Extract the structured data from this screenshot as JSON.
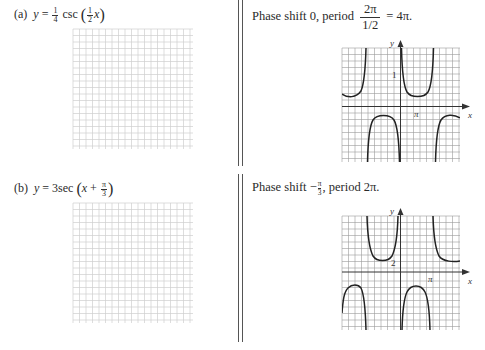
{
  "problems": [
    {
      "id": "a",
      "label": "(a)",
      "equation": {
        "lhs": "y",
        "equals": "=",
        "coef_num": "1",
        "coef_den": "4",
        "func": "csc",
        "arg_num": "1",
        "arg_den": "2",
        "arg_var": "x",
        "text": "y = (1/4) csc((1/2)x)"
      },
      "answer": {
        "prefix": "Phase shift 0, period",
        "frac_num": "2π",
        "frac_den": "1/2",
        "suffix": "= 4π.",
        "text": "Phase shift 0, period 2π/(1/2) = 4π."
      },
      "graph": {
        "y_axis_label": "y",
        "x_axis_label": "x",
        "y_tick_label": "1",
        "x_tick_label": "π"
      }
    },
    {
      "id": "b",
      "label": "(b)",
      "equation": {
        "lhs": "y",
        "equals": "=",
        "coef": "3",
        "func": "sec",
        "arg_var": "x",
        "arg_op": "+",
        "arg_num": "π",
        "arg_den": "3",
        "text": "y = 3 sec(x + π/3)"
      },
      "answer": {
        "prefix": "Phase shift −",
        "shift_num": "π",
        "shift_den": "3",
        "suffix": ", period 2π.",
        "text": "Phase shift −π/3, period 2π."
      },
      "graph": {
        "y_axis_label": "y",
        "x_axis_label": "x",
        "y_tick_label": "2",
        "x_tick_label": "π"
      }
    }
  ],
  "colors": {
    "grid_blank": "#cfcfcf",
    "grid_answer": "#9a9a9a",
    "curve": "#222222",
    "axis": "#333333",
    "divider": "#555555"
  }
}
